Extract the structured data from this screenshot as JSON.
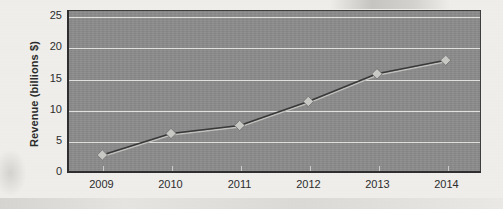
{
  "chart_data": {
    "type": "line",
    "title": "",
    "subtitle": "",
    "xlabel": "",
    "ylabel": "Revenue (billions $)",
    "categories": [
      "2009",
      "2010",
      "2011",
      "2012",
      "2013",
      "2014"
    ],
    "values": [
      2.6,
      6.1,
      7.4,
      11.3,
      15.8,
      18.0
    ],
    "series": [
      {
        "name": "Revenue",
        "values": [
          2.6,
          6.1,
          7.4,
          11.3,
          15.8,
          18.0
        ]
      }
    ],
    "ylim": [
      0,
      26
    ],
    "y_ticks": [
      0,
      5,
      10,
      15,
      20,
      25
    ],
    "y_tick_labels": [
      "0",
      "5",
      "10",
      "15",
      "20",
      "25"
    ],
    "x_tick_labels": [
      "2009",
      "2010",
      "2011",
      "2012",
      "2013",
      "2014"
    ],
    "grid": true,
    "grid_axis": "y",
    "legend": false,
    "legend_position": "none",
    "marker": "diamond",
    "annotations": [],
    "colors": {
      "plot_background": "#8d8d8d",
      "page_background": "#f0efec",
      "gridline": "#e9e9e6",
      "line": "#3a3a3a",
      "marker_fill": "#c9c9c6",
      "marker_edge": "#6f6f6f",
      "axis": "#2f2f2f",
      "text": "#2d2d2d"
    }
  }
}
